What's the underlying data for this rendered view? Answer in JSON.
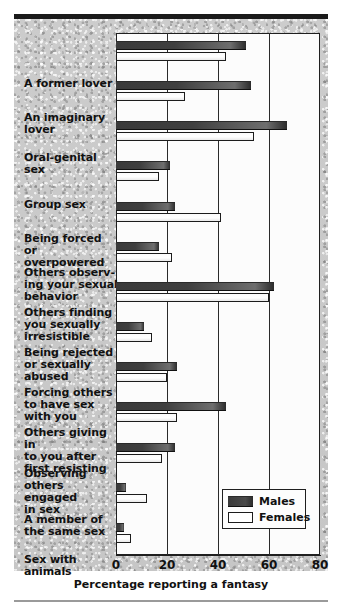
{
  "chart_data": {
    "type": "bar",
    "orientation": "horizontal",
    "title": "",
    "xlabel": "Percentage reporting a fantasy",
    "ylabel": "",
    "xlim": [
      0,
      80
    ],
    "xticks": [
      "0",
      "20",
      "40",
      "60",
      "80"
    ],
    "grid": true,
    "legend_position": "bottom-right",
    "categories": [
      "A former lover",
      "An imaginary lover",
      "Oral-genital sex",
      "Group sex",
      "Being forced or overpowered",
      "Others observing your sexual behavior",
      "Others finding you sexually irresistible",
      "Being rejected or sexually abused",
      "Forcing others to have sex with you",
      "Others giving in to you after first resisting",
      "Observing others engaged in sex",
      "A member of the same sex",
      "Sex with animals"
    ],
    "category_lines": [
      [
        "A former lover"
      ],
      [
        "An imaginary",
        "lover"
      ],
      [
        "Oral-genital",
        "sex"
      ],
      [
        "Group sex"
      ],
      [
        "Being forced",
        "or overpowered"
      ],
      [
        "Others observ-",
        "ing your sexual",
        "behavior"
      ],
      [
        "Others finding",
        "you sexually",
        "irresistible"
      ],
      [
        "Being rejected",
        "or sexually",
        "abused"
      ],
      [
        "Forcing others",
        "to have sex",
        "with you"
      ],
      [
        "Others giving in",
        "to you after",
        "first resisting"
      ],
      [
        "Observing",
        "others engaged",
        "in sex"
      ],
      [
        "A member of",
        "the same sex"
      ],
      [
        "Sex with",
        "animals"
      ]
    ],
    "series": [
      {
        "name": "Males",
        "color": "#3f3f3f",
        "values": [
          51,
          53,
          67,
          21,
          23,
          17,
          62,
          11,
          24,
          43,
          23,
          4,
          3
        ]
      },
      {
        "name": "Females",
        "color": "#ffffff",
        "values": [
          43,
          27,
          54,
          17,
          41,
          22,
          60,
          14,
          20,
          24,
          18,
          12,
          6
        ]
      }
    ]
  },
  "legend": {
    "items": [
      {
        "label": "Males",
        "swatch": "male-swatch"
      },
      {
        "label": "Females",
        "swatch": "female-swatch"
      }
    ]
  },
  "axis": {
    "x_label": "Percentage reporting a fantasy",
    "ticks": [
      {
        "value": 0,
        "label": "0"
      },
      {
        "value": 20,
        "label": "20"
      },
      {
        "value": 40,
        "label": "40"
      },
      {
        "value": 60,
        "label": "60"
      },
      {
        "value": 80,
        "label": "80"
      }
    ]
  }
}
